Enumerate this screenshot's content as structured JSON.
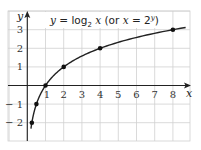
{
  "chart_data": {
    "type": "line",
    "title_parts": {
      "y": "y",
      "eq": " = log",
      "sub": "2",
      "x": " x",
      "paren_open": " (or ",
      "x2": "x",
      "eq2": " = 2",
      "sup": "y",
      "paren_close": ")"
    },
    "xlabel": "x",
    "ylabel": "y",
    "x_ticks": [
      "1",
      "2",
      "3",
      "4",
      "5",
      "6",
      "7",
      "8"
    ],
    "y_ticks": [
      "3",
      "2",
      "1",
      "-1",
      "-2"
    ],
    "xlim": [
      -1,
      9
    ],
    "ylim": [
      -3,
      4
    ],
    "grid": true,
    "series": [
      {
        "name": "y = log2 x",
        "points": [
          {
            "x": 0.25,
            "y": -2
          },
          {
            "x": 0.5,
            "y": -1
          },
          {
            "x": 1,
            "y": 0
          },
          {
            "x": 2,
            "y": 1
          },
          {
            "x": 4,
            "y": 2
          },
          {
            "x": 8,
            "y": 3
          }
        ],
        "curve_range": [
          0.2,
          8.7
        ],
        "color": "#222222"
      }
    ]
  }
}
